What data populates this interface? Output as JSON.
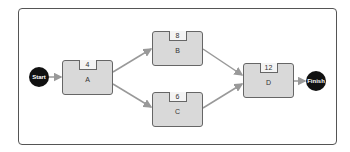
{
  "diagram": {
    "type": "activity-network",
    "start": {
      "label": "Start"
    },
    "finish": {
      "label": "Finish"
    },
    "nodes": [
      {
        "id": "A",
        "label": "A",
        "duration": "4"
      },
      {
        "id": "B",
        "label": "B",
        "duration": "8"
      },
      {
        "id": "C",
        "label": "C",
        "duration": "6"
      },
      {
        "id": "D",
        "label": "D",
        "duration": "12"
      }
    ],
    "edges": [
      {
        "from": "Start",
        "to": "A"
      },
      {
        "from": "A",
        "to": "B"
      },
      {
        "from": "A",
        "to": "C"
      },
      {
        "from": "B",
        "to": "D"
      },
      {
        "from": "C",
        "to": "D"
      },
      {
        "from": "D",
        "to": "Finish"
      }
    ],
    "colors": {
      "node_fill": "#d9d9d9",
      "terminal_fill": "#111111",
      "arrow": "#999999"
    }
  }
}
